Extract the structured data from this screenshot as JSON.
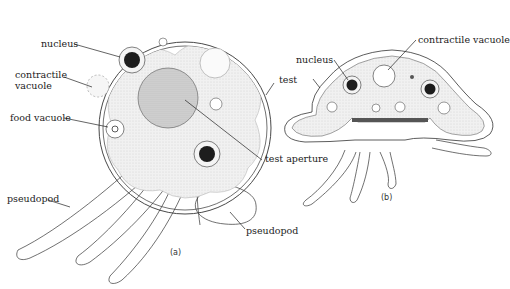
{
  "figure": {
    "panel_a": {
      "caption": "(a)",
      "labels": {
        "nucleus": "nucleus",
        "contractile_vacuole_line1": "contractile",
        "contractile_vacuole_line2": "vacuole",
        "food_vacuole": "food vacuole",
        "test": "test",
        "test_aperture": "test aperture",
        "pseudopod_left": "pseudopod",
        "pseudopod_right": "pseudopod"
      }
    },
    "panel_b": {
      "caption": "(b)",
      "labels": {
        "nucleus": "nucleus",
        "contractile_vacuole": "contractile vacuole"
      }
    },
    "colors": {
      "line": "#333333",
      "cytoplasm": "#ececec",
      "nucleus_dark": "#1a1a1a",
      "background": "#ffffff"
    }
  }
}
